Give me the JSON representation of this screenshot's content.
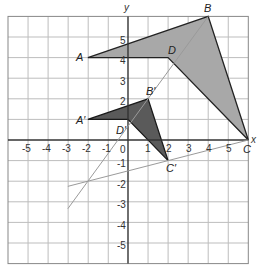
{
  "diagram": {
    "type": "coordinate-plane-dilation",
    "axes": {
      "x_label": "x",
      "y_label": "y",
      "origin_label": "0",
      "x_range": [
        -6,
        6
      ],
      "y_range": [
        -6,
        6
      ],
      "x_tick_labels": [
        "-5",
        "-4",
        "-3",
        "-2",
        "-1",
        "1",
        "2",
        "3",
        "4",
        "5"
      ],
      "y_tick_labels": [
        "5",
        "4",
        "3",
        "2",
        "-1",
        "-2",
        "-3",
        "-4",
        "-5"
      ]
    },
    "original_shape": {
      "fill": "#a8a8a8",
      "vertices": [
        {
          "label": "A",
          "x": -2,
          "y": 4
        },
        {
          "label": "B",
          "x": 4,
          "y": 6
        },
        {
          "label": "C",
          "x": 6,
          "y": 0
        },
        {
          "label": "D",
          "x": 2,
          "y": 4
        }
      ]
    },
    "image_shape": {
      "fill": "#5a5a5a",
      "vertices": [
        {
          "label": "A′",
          "x": -2,
          "y": 1
        },
        {
          "label": "B′",
          "x": 1,
          "y": 2
        },
        {
          "label": "C′",
          "x": 2,
          "y": -1
        },
        {
          "label": "D′",
          "x": 0,
          "y": 1
        }
      ]
    },
    "center_of_dilation": {
      "x": -2,
      "y": -2
    },
    "construction_lines": [
      {
        "from": {
          "x": -3,
          "y": -3.33
        },
        "to": {
          "x": 4,
          "y": 6
        },
        "through": "B, D, B′, D′"
      },
      {
        "from": {
          "x": -3,
          "y": -2.25
        },
        "to": {
          "x": 6,
          "y": 0
        },
        "through": "C, C′"
      }
    ],
    "colors": {
      "grid": "#bdbdbd",
      "axis": "#333333",
      "outline": "#222222",
      "construction": "#9a9a9a"
    }
  }
}
